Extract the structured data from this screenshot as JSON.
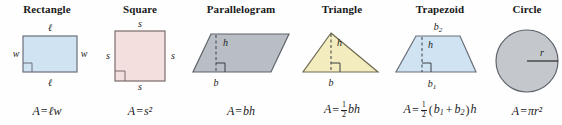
{
  "figure": {
    "background": "#fefefe"
  },
  "shapes": [
    {
      "key": "rectangle",
      "heading": "Rectangle",
      "fill": "#cfe3f2",
      "stroke": "#6a6f78",
      "formula_parts": {
        "lhs": "A",
        "eq": "=",
        "rhs": "ℓw"
      },
      "labels": [
        {
          "name": "top-length",
          "text": "ℓ"
        },
        {
          "name": "bottom-length",
          "text": "ℓ"
        },
        {
          "name": "left-width",
          "text": "w"
        },
        {
          "name": "right-width",
          "text": "w"
        }
      ],
      "has_right_angle_marker": true
    },
    {
      "key": "square",
      "heading": "Square",
      "fill": "#f4dfdf",
      "stroke": "#7a6a6a",
      "formula_parts": {
        "lhs": "A",
        "eq": "=",
        "rhs": "s²"
      },
      "labels": [
        {
          "name": "top-side",
          "text": "s"
        },
        {
          "name": "bottom-side",
          "text": "s"
        },
        {
          "name": "left-side",
          "text": "s"
        },
        {
          "name": "right-side",
          "text": "s"
        }
      ],
      "has_right_angle_marker": true
    },
    {
      "key": "parallelogram",
      "heading": "Parallelogram",
      "fill": "#b9bec4",
      "stroke": "#5d636b",
      "formula_parts": {
        "lhs": "A",
        "eq": "=",
        "rhs": "bh"
      },
      "labels": [
        {
          "name": "height",
          "text": "h"
        },
        {
          "name": "base",
          "text": "b"
        }
      ],
      "has_right_angle_marker": true,
      "has_dashed_height": true
    },
    {
      "key": "triangle",
      "heading": "Triangle",
      "fill": "#f2ecbe",
      "stroke": "#6f6a52",
      "formula_parts": {
        "lhs": "A",
        "eq": "=",
        "fraction": {
          "num": "1",
          "den": "2"
        },
        "rhs": "bh"
      },
      "labels": [
        {
          "name": "height",
          "text": "h"
        },
        {
          "name": "base",
          "text": "b"
        }
      ],
      "has_right_angle_marker": true,
      "has_dashed_height": true
    },
    {
      "key": "trapezoid",
      "heading": "Trapezoid",
      "fill": "#cfe3f2",
      "stroke": "#6a6f78",
      "formula_parts": {
        "lhs": "A",
        "eq": "=",
        "fraction": {
          "num": "1",
          "den": "2"
        },
        "group_open": "(",
        "b1": "b",
        "b1_sub": "1",
        "plus": "+",
        "b2": "b",
        "b2_sub": "2",
        "group_close": ")",
        "rhs": "h"
      },
      "labels": [
        {
          "name": "top-base",
          "text": "b",
          "sub": "2"
        },
        {
          "name": "height",
          "text": "h"
        },
        {
          "name": "bottom-base",
          "text": "b",
          "sub": "1"
        }
      ],
      "has_right_angle_marker": true,
      "has_dashed_height": true
    },
    {
      "key": "circle",
      "heading": "Circle",
      "fill": "#c4c8cd",
      "stroke": "#5d636b",
      "formula_parts": {
        "lhs": "A",
        "eq": "=",
        "pi": "π",
        "rhs": "r²"
      },
      "labels": [
        {
          "name": "radius",
          "text": "r"
        }
      ],
      "has_radius_line": true
    }
  ]
}
